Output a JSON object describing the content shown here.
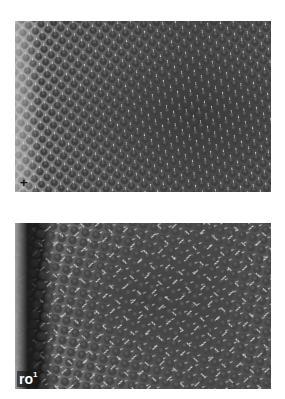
{
  "figure": {
    "panels": [
      {
        "id": "top",
        "label": "+",
        "description": "Scanning electron micrograph of a wild-type compound eye with regularly ordered ommatidia and bristles"
      },
      {
        "id": "bottom",
        "label_base": "ro",
        "label_superscript": "1",
        "description": "Scanning electron micrograph of a rough-eye mutant compound eye with disordered ommatidia and bristles"
      }
    ]
  }
}
